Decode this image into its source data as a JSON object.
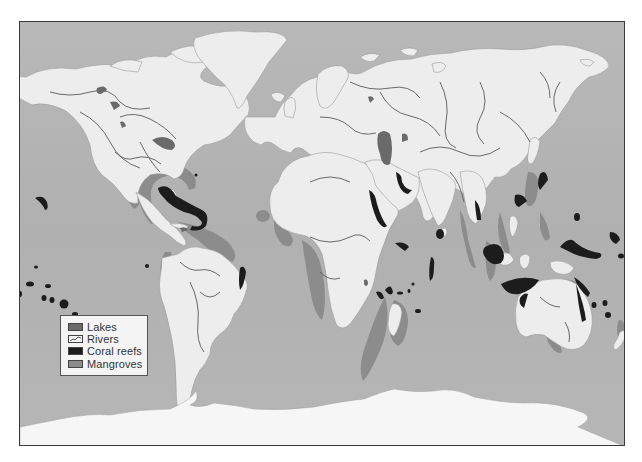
{
  "map": {
    "title": "World map of freshwater and coastal ecosystems",
    "colors": {
      "ocean": "#b3b3b3",
      "land": "#ededed",
      "lakes": "#6a6a6a",
      "rivers": "#555555",
      "coral_reefs": "#1c1c1c",
      "mangroves": "#8c8c8c",
      "ice": "#f6f6f6"
    }
  },
  "legend": {
    "items": [
      {
        "label": "Lakes",
        "swatch": "#6a6a6a",
        "icon": "lakes-swatch"
      },
      {
        "label": "Rivers",
        "swatch": "#f4f4f4",
        "icon": "rivers-swatch"
      },
      {
        "label": "Coral reefs",
        "swatch": "#1c1c1c",
        "icon": "coral-reefs-swatch"
      },
      {
        "label": "Mangroves",
        "swatch": "#8c8c8c",
        "icon": "mangroves-swatch"
      }
    ]
  }
}
